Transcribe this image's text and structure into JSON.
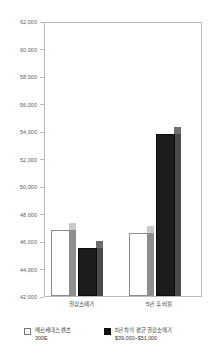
{
  "chart_data": {
    "type": "bar",
    "title": "",
    "xlabel": "",
    "ylabel": "",
    "categories": [
      "권장소매가",
      "5년 후 비율"
    ],
    "series": [
      {
        "name": "메르세데스 벤츠 300E",
        "name_line1": "메르세데스 벤츠",
        "name_line2": "300E",
        "color": "#ffffff",
        "values": [
          46800,
          46600
        ]
      },
      {
        "name": "5년 차의 평균 권장소매가 $39,000~$51,000",
        "name_line1": "5년 차의 평균 권장소매가",
        "name_line2": "$39,000~$51,000",
        "color": "#111111",
        "values": [
          45500,
          53900
        ]
      }
    ],
    "ylim": [
      42000,
      62000
    ],
    "ytick_step": 2000,
    "yticks": [
      "62,000",
      "60,000",
      "58,000",
      "56,000",
      "54,000",
      "52,000",
      "50,000",
      "48,000",
      "46,000",
      "44,000",
      "42,000"
    ],
    "grid": false,
    "legend_position": "bottom",
    "style": "3d-bar",
    "frame_color": "#b9b9b9",
    "text_color": "#5a5a5a"
  }
}
